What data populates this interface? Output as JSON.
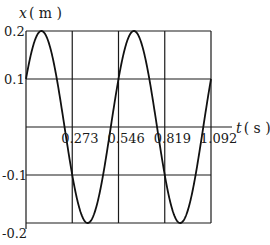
{
  "chart_data": {
    "type": "line",
    "title": "",
    "xlabel": "t ( s )",
    "ylabel": "x ( m )",
    "xlabel_var": "t",
    "xlabel_unit": "( s )",
    "ylabel_var": "x",
    "ylabel_unit": "( m )",
    "xlim": [
      0,
      1.092
    ],
    "ylim": [
      -0.2,
      0.2
    ],
    "x_ticks": [
      "0.273",
      "0.546",
      "0.819",
      "1.092"
    ],
    "x_tick_values": [
      0.273,
      0.546,
      0.819,
      1.092
    ],
    "y_ticks": [
      "0.2",
      "0.1",
      "-0.1",
      "-0.2"
    ],
    "y_tick_values": [
      0.2,
      0.1,
      -0.1,
      -0.2
    ],
    "grid": true,
    "series": [
      {
        "name": "x(t) = 0.2 sin(2πt/0.546 + π/6)",
        "amplitude": 0.2,
        "period": 0.546,
        "phase_rad": 0.5236,
        "x": [
          0,
          0.091,
          0.182,
          0.228,
          0.273,
          0.364,
          0.455,
          0.5,
          0.546,
          0.637,
          0.728,
          0.774,
          0.819,
          0.91,
          1.001,
          1.046,
          1.092
        ],
        "values": [
          0.1,
          0.2,
          0.1,
          0,
          -0.1,
          -0.2,
          -0.1,
          0,
          0.1,
          0.2,
          0.1,
          0,
          -0.1,
          -0.2,
          -0.1,
          0,
          0.1
        ]
      }
    ]
  },
  "colors": {
    "line": "#111111",
    "grid": "#1a1a1a",
    "background": "#ffffff"
  }
}
